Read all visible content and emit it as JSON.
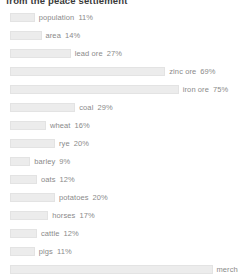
{
  "title": "from the peace settlement",
  "chart_data": {
    "type": "bar",
    "title": "from the peace settlement",
    "xlabel": "",
    "ylabel": "",
    "xlim": [
      0,
      100
    ],
    "grid": false,
    "legend": null,
    "orientation": "horizontal",
    "unit": "%",
    "bar_color": "#ececec",
    "label_color": "#8a8a8a",
    "categories": [
      "population",
      "area",
      "lead ore",
      "zinc ore",
      "iron ore",
      "coal",
      "wheat",
      "rye",
      "barley",
      "oats",
      "potatoes",
      "horses",
      "cattle",
      "pigs",
      "merchant fleet"
    ],
    "values": [
      11,
      14,
      27,
      69,
      75,
      29,
      16,
      20,
      9,
      12,
      20,
      17,
      12,
      11,
      90
    ],
    "rows": [
      {
        "label": "population",
        "value": 11,
        "value_text": "11%"
      },
      {
        "label": "area",
        "value": 14,
        "value_text": "14%"
      },
      {
        "label": "lead ore",
        "value": 27,
        "value_text": "27%"
      },
      {
        "label": "zinc ore",
        "value": 69,
        "value_text": "69%"
      },
      {
        "label": "iron ore",
        "value": 75,
        "value_text": "75%"
      },
      {
        "label": "coal",
        "value": 29,
        "value_text": "29%"
      },
      {
        "label": "wheat",
        "value": 16,
        "value_text": "16%"
      },
      {
        "label": "rye",
        "value": 20,
        "value_text": "20%"
      },
      {
        "label": "barley",
        "value": 9,
        "value_text": "9%"
      },
      {
        "label": "oats",
        "value": 12,
        "value_text": "12%"
      },
      {
        "label": "potatoes",
        "value": 20,
        "value_text": "20%"
      },
      {
        "label": "horses",
        "value": 17,
        "value_text": "17%"
      },
      {
        "label": "cattle",
        "value": 12,
        "value_text": "12%"
      },
      {
        "label": "pigs",
        "value": 11,
        "value_text": "11%"
      },
      {
        "label": "merchant fleet",
        "value": 90,
        "value_text": "90%"
      }
    ]
  }
}
